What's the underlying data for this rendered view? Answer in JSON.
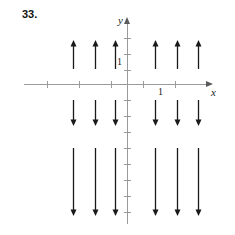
{
  "figure": {
    "problem_number": "33.",
    "type": "direction-field",
    "background_color": "#ffffff",
    "axis_color": "#9a9a9a",
    "vector_color": "#1a1a1a"
  },
  "axes": {
    "y_label": "y",
    "x_label": "x",
    "y_tick_label": "1",
    "x_tick_label": "1",
    "origin_px": {
      "x": 127,
      "y": 84
    },
    "unit_px": 16,
    "y_ticks_px": [
      38,
      54,
      70,
      100,
      116,
      132,
      148,
      164,
      180,
      196,
      212
    ],
    "x_ticks_px": [
      47,
      79,
      111,
      143,
      175
    ]
  },
  "chart_data": {
    "type": "scatter",
    "title": "33.",
    "xlabel": "x",
    "ylabel": "y",
    "grid": false,
    "legend": null,
    "xlim": [
      -6.4,
      5.2
    ],
    "ylim": [
      -8.2,
      3.9
    ],
    "columns_x": [
      -3.4,
      -2.0,
      -0.7,
      1.8,
      3.1,
      4.4
    ],
    "rows": [
      {
        "y": 2.8,
        "direction": "up",
        "length_units": 1.8
      },
      {
        "y": -1.6,
        "direction": "down",
        "length_units": 1.6
      },
      {
        "y": -5.0,
        "direction": "down",
        "length_units": 4.2
      }
    ],
    "vectors": [
      {
        "col": 0,
        "x_px": 73,
        "row": 0,
        "y_top_px": 40,
        "y_bottom_px": 69,
        "dir": "up"
      },
      {
        "col": 1,
        "x_px": 95,
        "row": 0,
        "y_top_px": 40,
        "y_bottom_px": 69,
        "dir": "up"
      },
      {
        "col": 2,
        "x_px": 115,
        "row": 0,
        "y_top_px": 40,
        "y_bottom_px": 69,
        "dir": "up"
      },
      {
        "col": 3,
        "x_px": 155,
        "row": 0,
        "y_top_px": 40,
        "y_bottom_px": 69,
        "dir": "up"
      },
      {
        "col": 4,
        "x_px": 177,
        "row": 0,
        "y_top_px": 40,
        "y_bottom_px": 69,
        "dir": "up"
      },
      {
        "col": 5,
        "x_px": 198,
        "row": 0,
        "y_top_px": 40,
        "y_bottom_px": 69,
        "dir": "up"
      },
      {
        "col": 0,
        "x_px": 73,
        "row": 1,
        "y_top_px": 100,
        "y_bottom_px": 126,
        "dir": "down"
      },
      {
        "col": 1,
        "x_px": 95,
        "row": 1,
        "y_top_px": 100,
        "y_bottom_px": 126,
        "dir": "down"
      },
      {
        "col": 2,
        "x_px": 115,
        "row": 1,
        "y_top_px": 100,
        "y_bottom_px": 126,
        "dir": "down"
      },
      {
        "col": 3,
        "x_px": 155,
        "row": 1,
        "y_top_px": 100,
        "y_bottom_px": 126,
        "dir": "down"
      },
      {
        "col": 4,
        "x_px": 177,
        "row": 1,
        "y_top_px": 100,
        "y_bottom_px": 126,
        "dir": "down"
      },
      {
        "col": 5,
        "x_px": 198,
        "row": 1,
        "y_top_px": 100,
        "y_bottom_px": 126,
        "dir": "down"
      },
      {
        "col": 0,
        "x_px": 73,
        "row": 2,
        "y_top_px": 148,
        "y_bottom_px": 216,
        "dir": "down"
      },
      {
        "col": 1,
        "x_px": 95,
        "row": 2,
        "y_top_px": 148,
        "y_bottom_px": 216,
        "dir": "down"
      },
      {
        "col": 2,
        "x_px": 115,
        "row": 2,
        "y_top_px": 148,
        "y_bottom_px": 216,
        "dir": "down"
      },
      {
        "col": 3,
        "x_px": 155,
        "row": 2,
        "y_top_px": 148,
        "y_bottom_px": 216,
        "dir": "down"
      },
      {
        "col": 4,
        "x_px": 177,
        "row": 2,
        "y_top_px": 148,
        "y_bottom_px": 216,
        "dir": "down"
      },
      {
        "col": 5,
        "x_px": 198,
        "row": 2,
        "y_top_px": 148,
        "y_bottom_px": 216,
        "dir": "down"
      }
    ]
  }
}
